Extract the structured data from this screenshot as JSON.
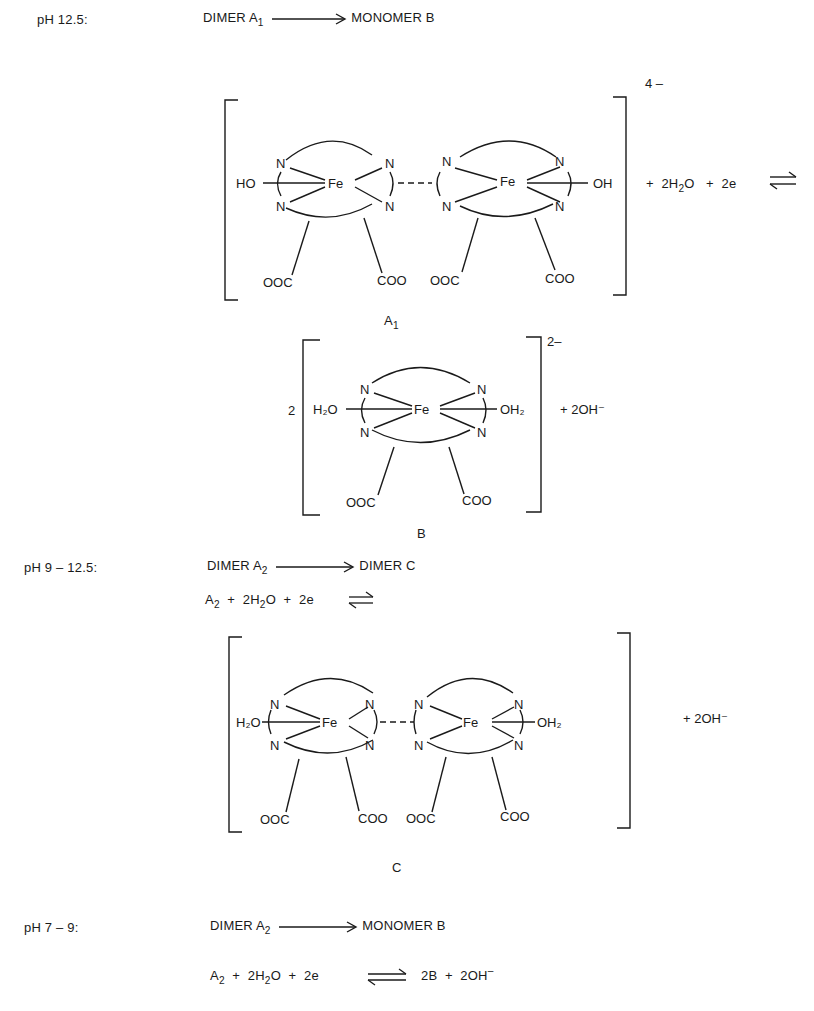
{
  "conditions": [
    {
      "ph_label": "pH    12.5:",
      "summary": {
        "reactant": "DIMER A",
        "reactant_sub": "1",
        "product": "MONOMER B"
      }
    },
    {
      "ph_label": "pH 9 – 12.5:",
      "summary": {
        "reactant": "DIMER A",
        "reactant_sub": "2",
        "product": "DIMER C"
      },
      "equation": {
        "a": "A",
        "a_sub": "2",
        "plus1": "+",
        "water": "2H",
        "water_sub": "2",
        "water_tail": "O",
        "plus2": "+",
        "electrons": "2e"
      }
    },
    {
      "ph_label": "pH 7 – 9:",
      "summary": {
        "reactant": "DIMER A",
        "reactant_sub": "2",
        "product": "MONOMER B"
      },
      "equation": {
        "a": "A",
        "a_sub": "2",
        "plus1": "+",
        "water": "2H",
        "water_sub": "2",
        "water_tail": "O",
        "plus2": "+",
        "electrons": "2e",
        "product1": "2B",
        "plus3": "+",
        "product2": "2OH",
        "product2_sup": "–"
      }
    }
  ],
  "structures": {
    "A1": {
      "label": "A",
      "label_sub": "1",
      "charge": "4 –",
      "left_ligand": "HO",
      "right_ligand": "OH",
      "metal": "Fe",
      "donor": "N",
      "carboxylates": [
        "OOC",
        "COO",
        "OOC",
        "COO"
      ],
      "rhs": {
        "plus1": "+",
        "water": "2H",
        "water_sub": "2",
        "water_tail": "O",
        "plus2": "+",
        "electrons": "2e"
      }
    },
    "B": {
      "label": "B",
      "coefficient": "2",
      "charge": "2–",
      "left_ligand": "H₂O",
      "right_ligand": "OH₂",
      "metal": "Fe",
      "donor": "N",
      "carboxylates": [
        "OOC",
        "COO"
      ],
      "rhs": "+ 2OH⁻"
    },
    "C": {
      "label": "C",
      "left_ligand": "H₂O",
      "right_ligand": "OH₂",
      "metal": "Fe",
      "donor": "N",
      "carboxylates": [
        "OOC",
        "COO",
        "OOC",
        "COO"
      ],
      "rhs": "+ 2OH⁻"
    }
  },
  "icons": {
    "forward_arrow": "long-right-arrow",
    "equilibrium_arrow": "harpoons-equilibrium"
  }
}
